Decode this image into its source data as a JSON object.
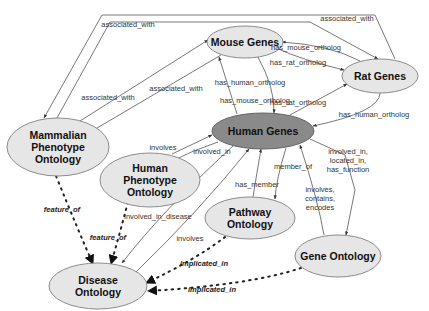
{
  "diagram": {
    "nodes": [
      {
        "id": "mouse",
        "label": [
          "Mouse Genes"
        ]
      },
      {
        "id": "rat",
        "label": [
          "Rat Genes"
        ]
      },
      {
        "id": "human",
        "label": [
          "Human Genes"
        ]
      },
      {
        "id": "mpo",
        "label": [
          "Mammalian",
          "Phenotype",
          "Ontology"
        ]
      },
      {
        "id": "hpo",
        "label": [
          "Human",
          "Phenotype",
          "Ontology"
        ]
      },
      {
        "id": "pw",
        "label": [
          "Pathway",
          "Ontology"
        ]
      },
      {
        "id": "go",
        "label": [
          "Gene Ontology"
        ]
      },
      {
        "id": "do",
        "label": [
          "Disease",
          "Ontology"
        ]
      }
    ],
    "edges": [
      {
        "from": "rat",
        "to": "mpo",
        "label": [
          "associated_with"
        ],
        "style": "solid"
      },
      {
        "from": "mpo",
        "to": "rat",
        "label": [
          "associated_with"
        ],
        "style": "solid"
      },
      {
        "from": "mpo",
        "to": "mouse",
        "label": [
          "associated_with"
        ],
        "style": "solid"
      },
      {
        "from": "mouse",
        "to": "mpo",
        "label": [
          "associated_with"
        ],
        "style": "solid"
      },
      {
        "from": "rat",
        "to": "mouse",
        "label": [
          "has_mouse_ortholog"
        ],
        "style": "solid"
      },
      {
        "from": "mouse",
        "to": "rat",
        "label": [
          "has_rat_ortholog"
        ],
        "style": "solid"
      },
      {
        "from": "mouse",
        "to": "human",
        "label": [
          "has_human_ortholog"
        ],
        "style": "solid"
      },
      {
        "from": "human",
        "to": "mouse",
        "label": [
          "has_mouse_ortholog"
        ],
        "style": "solid"
      },
      {
        "from": "human",
        "to": "rat",
        "label": [
          "has_rat_ortholog"
        ],
        "style": "solid"
      },
      {
        "from": "rat",
        "to": "human",
        "label": [
          "has_human_ortholog"
        ],
        "style": "solid"
      },
      {
        "from": "hpo",
        "to": "human",
        "label": [
          "involves"
        ],
        "style": "solid"
      },
      {
        "from": "human",
        "to": "hpo",
        "label": [
          "involved_in"
        ],
        "style": "solid"
      },
      {
        "from": "human",
        "to": "do",
        "label": [
          "involved_in_disease"
        ],
        "style": "solid"
      },
      {
        "from": "do",
        "to": "human",
        "label": [
          "involves"
        ],
        "style": "solid"
      },
      {
        "from": "pw",
        "to": "human",
        "label": [
          "has_member"
        ],
        "style": "solid"
      },
      {
        "from": "human",
        "to": "pw",
        "label": [
          "member_of"
        ],
        "style": "solid"
      },
      {
        "from": "go",
        "to": "human",
        "label": [
          "involves,",
          "contains,",
          "encodes"
        ],
        "style": "solid"
      },
      {
        "from": "human",
        "to": "go",
        "label": [
          "involved_in,",
          "located_in,",
          "has_function"
        ],
        "style": "solid"
      },
      {
        "from": "mpo",
        "to": "do",
        "label": [
          "feature_of"
        ],
        "style": "dotted"
      },
      {
        "from": "hpo",
        "to": "do",
        "label": [
          "feature_of"
        ],
        "style": "dotted"
      },
      {
        "from": "pw",
        "to": "do",
        "label": [
          "implicated_in"
        ],
        "style": "dotted"
      },
      {
        "from": "go",
        "to": "do",
        "label": [
          "implicated_in"
        ],
        "style": "dotted"
      }
    ]
  }
}
